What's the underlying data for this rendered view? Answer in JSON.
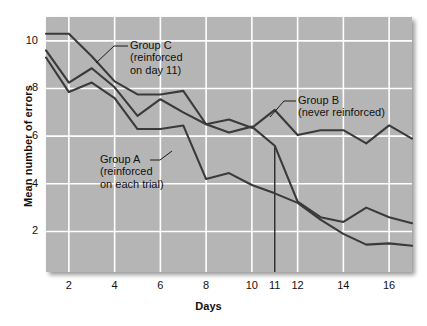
{
  "chart_data": {
    "type": "line",
    "title": "",
    "xlabel": "Days",
    "ylabel": "Mean number of errors",
    "xlim": [
      1,
      17
    ],
    "ylim": [
      0.3,
      11.0
    ],
    "grid": true,
    "grid_color": "#ffffff",
    "plot_background": "#b5b5b5",
    "line_color": "#3a3a3a",
    "legend_position": "inline-annotations",
    "xticks": [
      2,
      4,
      6,
      8,
      10,
      11,
      12,
      14,
      16
    ],
    "yticks": [
      2,
      4,
      6,
      8,
      10
    ],
    "x": [
      1,
      2,
      3,
      4,
      5,
      6,
      7,
      8,
      9,
      10,
      11,
      12,
      13,
      14,
      15,
      16,
      17
    ],
    "series": [
      {
        "name": "Group A",
        "annotation": "Group A\n(reinforced\non each trial)",
        "annotation_line1": "Group A",
        "annotation_line2": "(reinforced",
        "annotation_line3": "on each trial)",
        "values": [
          9.3,
          7.85,
          8.25,
          7.6,
          6.3,
          6.3,
          6.45,
          4.2,
          4.45,
          3.95,
          3.6,
          3.2,
          2.5,
          1.9,
          1.45,
          1.5,
          1.4
        ]
      },
      {
        "name": "Group B",
        "annotation": "Group B\n(never reinforced)",
        "annotation_line1": "Group B",
        "annotation_line2": "(never reinforced)",
        "values": [
          9.6,
          8.25,
          8.85,
          8.05,
          6.85,
          7.55,
          7.0,
          6.5,
          6.7,
          6.35,
          7.1,
          6.05,
          6.25,
          6.25,
          5.7,
          6.45,
          5.9
        ]
      },
      {
        "name": "Group C",
        "annotation": "Group C\n(reinforced\non day 11)",
        "annotation_line1": "Group C",
        "annotation_line2": "(reinforced",
        "annotation_line3": "on day 11)",
        "values": [
          10.3,
          10.3,
          9.35,
          8.3,
          7.75,
          7.75,
          7.9,
          6.5,
          6.15,
          6.4,
          5.6,
          3.25,
          2.6,
          2.4,
          3.0,
          2.6,
          2.35
        ]
      }
    ],
    "marker_line": {
      "name": "day-11-marker",
      "x": 11,
      "y_top": 5.6,
      "y_bottom": 0.3
    }
  }
}
